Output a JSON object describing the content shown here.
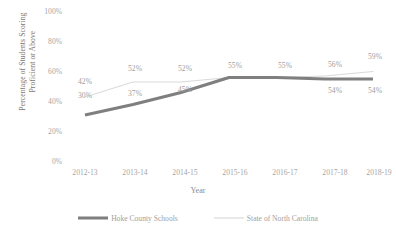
{
  "chart_data": {
    "type": "line",
    "title": "",
    "xlabel": "Year",
    "ylabel": "Percentage of Students Scoring Proficient or Above",
    "ylabel_line1": "Percentage of Students Scoring",
    "ylabel_line2": "Proficient or Above",
    "categories": [
      "2012-13",
      "2013-14",
      "2014-15",
      "2015-16",
      "2016-17",
      "2017-18",
      "2018-19"
    ],
    "ylim": [
      0,
      100
    ],
    "yticks": [
      "0%",
      "20%",
      "40%",
      "60%",
      "80%",
      "100%"
    ],
    "ytick_values": [
      0,
      20,
      40,
      60,
      80,
      100
    ],
    "grid": false,
    "legend_position": "bottom",
    "series": [
      {
        "name": "Hoke County Schools",
        "color": "#7f7f7f",
        "width": 3,
        "values": [
          30,
          37,
          45,
          55,
          55,
          54,
          54
        ],
        "labels": [
          "30%",
          "37%",
          "45%",
          "55%",
          "55%",
          "54%",
          "54%"
        ],
        "labels_shown": [
          "30%",
          "37%",
          "45%",
          "",
          "",
          "54%",
          "54%"
        ]
      },
      {
        "name": "State of North Carolina",
        "color": "#d9d9d9",
        "width": 1,
        "values": [
          42,
          52,
          52,
          55,
          55,
          56,
          59
        ],
        "labels": [
          "42%",
          "52%",
          "52%",
          "55%",
          "55%",
          "56%",
          "59%"
        ],
        "labels_shown": [
          "42%",
          "52%",
          "52%",
          "55%",
          "55%",
          "56%",
          "59%"
        ]
      }
    ]
  },
  "legend": {
    "items": [
      {
        "label": "Hoke County Schools"
      },
      {
        "label": "State of North Carolina"
      }
    ]
  }
}
